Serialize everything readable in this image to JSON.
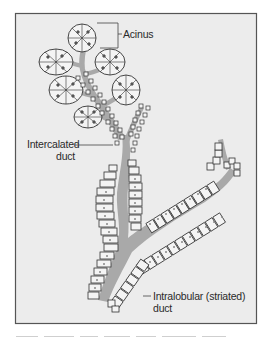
{
  "figure": {
    "labels": {
      "acinus": "Acinus",
      "intercalated_line1": "Intercalated",
      "intercalated_line2": "duct",
      "intralobular_line1": "Intralobular (striated)",
      "intralobular_line2": "duct"
    },
    "colors": {
      "frame_border": "#555555",
      "frame_fill": "#ececec",
      "lumen": "#a9a9a9",
      "cell_fill": "#f4f4f4",
      "cell_outline": "#333333",
      "nucleus": "#888888",
      "text": "#2a2a2a"
    }
  }
}
